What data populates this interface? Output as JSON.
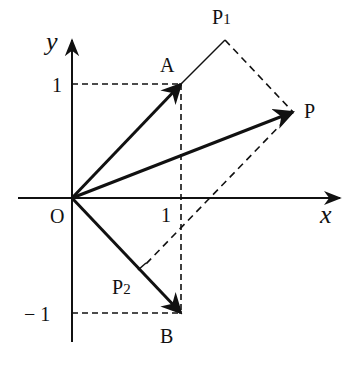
{
  "diagram": {
    "type": "vector-rotation-diagram",
    "axes": {
      "x_label": "x",
      "y_label": "y",
      "origin_label": "O",
      "x_tick_label": "1",
      "y_tick_pos_label": "1",
      "y_tick_neg_label": "− 1"
    },
    "points": {
      "A": {
        "label": "A",
        "coords": [
          1,
          1
        ]
      },
      "B": {
        "label": "B",
        "coords": [
          1,
          -1
        ]
      },
      "P": {
        "label": "P"
      },
      "P1": {
        "label": "P",
        "sub": "1"
      },
      "P2": {
        "label": "P",
        "sub": "2"
      }
    },
    "vectors": [
      "OA",
      "OB",
      "OP"
    ],
    "solid_segments": [
      "AP1"
    ],
    "dashed_segments": [
      "P1P",
      "PP2",
      "y=1 guide",
      "y=-1 guide",
      "x=1 guide"
    ],
    "colors": {
      "stroke": "#111111",
      "background": "#ffffff"
    }
  }
}
